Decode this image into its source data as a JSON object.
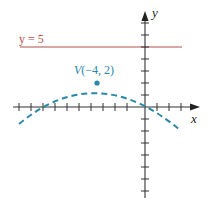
{
  "diagram": {
    "type": "coordinate-graph",
    "axes": {
      "x_label": "x",
      "y_label": "y",
      "x_range": [
        -11,
        4
      ],
      "y_range": [
        -6,
        8
      ],
      "tick_step": 1
    },
    "horizontal_line": {
      "label": "y = 5",
      "y": 5,
      "color": "#b5524a"
    },
    "parabola": {
      "style": "dashed",
      "color": "#2a87a8",
      "vertex": {
        "x": -4,
        "y": 2
      },
      "vertex_label_prefix": "V",
      "vertex_label_coords": "(−4, 2)",
      "x_intercepts": [
        -9,
        1
      ],
      "opens": "down"
    }
  }
}
